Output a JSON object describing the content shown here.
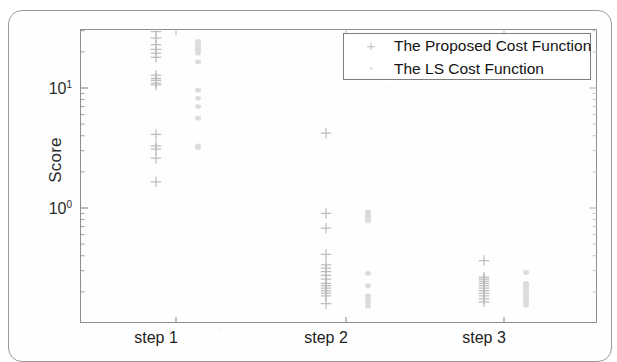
{
  "figure": {
    "ylabel": "Score",
    "y_ticks": [
      {
        "label_base": "10",
        "label_exp": "1",
        "value": 10
      },
      {
        "label_base": "10",
        "label_exp": "0",
        "value": 1
      }
    ],
    "x_ticks": [
      "step 1",
      "step 2",
      "step 3"
    ],
    "legend": {
      "items": [
        {
          "marker": "plus-marker-icon",
          "glyph": "+",
          "label": "The Proposed Cost Function",
          "color": "#c6c6c6"
        },
        {
          "marker": "dot-marker-icon",
          "glyph": "•",
          "label": "The LS Cost Function",
          "color": "#dcdcdc"
        }
      ]
    }
  },
  "chart_data": {
    "type": "scatter",
    "title": "",
    "xlabel": "",
    "ylabel": "Score",
    "yscale": "log",
    "ylim": [
      0.14,
      32
    ],
    "grid": false,
    "legend_position": "top-right",
    "categories": [
      "step 1",
      "step 2",
      "step 3"
    ],
    "series": [
      {
        "name": "The Proposed Cost Function",
        "marker": "+",
        "color": "#bdbdbd",
        "groups": [
          {
            "category": "step 1",
            "values": [
              29.5,
              26.0,
              23.0,
              21.0,
              19.5,
              18.0,
              12.8,
              12.0,
              11.6,
              11.0,
              10.6,
              4.1,
              3.3,
              3.1,
              2.6,
              1.65
            ]
          },
          {
            "category": "step 2",
            "values": [
              4.2,
              0.9,
              0.68,
              0.41,
              0.335,
              0.315,
              0.295,
              0.275,
              0.255,
              0.235,
              0.225,
              0.215,
              0.205,
              0.195,
              0.185,
              0.16
            ]
          },
          {
            "category": "step 3",
            "values": [
              0.365,
              0.265,
              0.255,
              0.245,
              0.235,
              0.225,
              0.215,
              0.205,
              0.195,
              0.185,
              0.175,
              0.165
            ]
          }
        ]
      },
      {
        "name": "The LS Cost Function",
        "marker": ".",
        "color": "#dcdcdc",
        "groups": [
          {
            "category": "step 1",
            "values": [
              24.5,
              23.5,
              22.5,
              21.5,
              20.5,
              19.5,
              16.5,
              9.6,
              8.2,
              7.0,
              5.6,
              3.3,
              3.2
            ]
          },
          {
            "category": "step 2",
            "values": [
              0.93,
              0.9,
              0.87,
              0.84,
              0.81,
              0.78,
              0.285,
              0.225,
              0.185,
              0.175,
              0.162,
              0.152
            ]
          },
          {
            "category": "step 3",
            "values": [
              0.29,
              0.235,
              0.225,
              0.215,
              0.205,
              0.195,
              0.185,
              0.175,
              0.165,
              0.155
            ]
          }
        ]
      }
    ]
  }
}
